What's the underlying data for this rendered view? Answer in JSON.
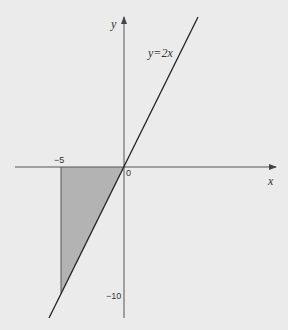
{
  "diagram": {
    "title": "",
    "axes": {
      "x_label": "x",
      "y_label": "y",
      "origin_label": "0",
      "x_tick_label": "−5",
      "y_tick_label": "−10"
    },
    "curve": {
      "equation_label": "y=2x",
      "type": "line",
      "slope": 2,
      "intercept": 0
    },
    "shaded_region": {
      "description": "Triangle bounded by y=2x, x=-5 and the x-axis",
      "vertices": [
        [
          -5,
          0
        ],
        [
          0,
          0
        ],
        [
          -5,
          -10
        ]
      ],
      "fill_color": "#b3b3b3"
    },
    "colors": {
      "background": "#ebebeb",
      "axis": "#555555",
      "line": "#222222",
      "shade": "#b3b3b3"
    }
  }
}
